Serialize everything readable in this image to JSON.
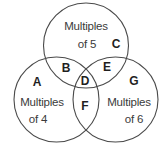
{
  "diagram": {
    "type": "venn",
    "sets": [
      {
        "id": "five",
        "label_line1": "Multiples",
        "label_line2": "of 5",
        "circle": {
          "cx": 86,
          "cy": 45.5,
          "r": 42.5
        }
      },
      {
        "id": "four",
        "label_line1": "Multiples",
        "label_line2": "of 4",
        "circle": {
          "cx": 56.5,
          "cy": 99.5,
          "r": 42.5
        }
      },
      {
        "id": "six",
        "label_line1": "Multiples",
        "label_line2": "of 6",
        "circle": {
          "cx": 115.5,
          "cy": 99.5,
          "r": 42.5
        }
      }
    ],
    "regions": [
      {
        "letter": "A",
        "description": "Multiples of 4 only"
      },
      {
        "letter": "B",
        "description": "Multiples of 4 and 5"
      },
      {
        "letter": "C",
        "description": "Multiples of 5 only"
      },
      {
        "letter": "D",
        "description": "Multiples of 4, 5 and 6"
      },
      {
        "letter": "E",
        "description": "Multiples of 5 and 6"
      },
      {
        "letter": "F",
        "description": "Multiples of 4 and 6"
      },
      {
        "letter": "G",
        "description": "Multiples of 6 only"
      }
    ],
    "colors": {
      "stroke": "#4a4a4a",
      "text": "#2f2f2f",
      "background": "#ffffff"
    }
  }
}
